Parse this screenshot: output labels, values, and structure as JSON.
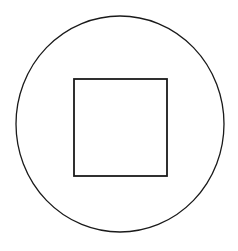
{
  "figure": {
    "background": "#ffffff",
    "stroke": "#1a1a1a",
    "shapes": [
      {
        "type": "circle",
        "cx": 120,
        "cy": 124,
        "rx": 104,
        "ry": 108
      },
      {
        "type": "square",
        "x": 74,
        "y": 79,
        "width": 93,
        "height": 97
      }
    ]
  }
}
